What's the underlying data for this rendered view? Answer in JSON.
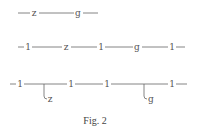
{
  "figure": {
    "caption": "Fig. 2",
    "rows": [
      {
        "id": "row1",
        "line": {
          "x1": 18,
          "x2": 98,
          "y": 13
        },
        "nodes": [
          {
            "label": "z",
            "x": 34
          },
          {
            "label": "g",
            "x": 78
          }
        ]
      },
      {
        "id": "row2",
        "line": {
          "x1": 18,
          "x2": 185,
          "y": 47
        },
        "nodes": [
          {
            "label": "1",
            "x": 28
          },
          {
            "label": "z",
            "x": 66
          },
          {
            "label": "1",
            "x": 101
          },
          {
            "label": "g",
            "x": 137
          },
          {
            "label": "1",
            "x": 172
          }
        ]
      },
      {
        "id": "row3",
        "line": {
          "x1": 10,
          "x2": 187,
          "y": 84
        },
        "nodes": [
          {
            "label": "1",
            "x": 20
          },
          {
            "label": "1",
            "x": 71
          },
          {
            "label": "1",
            "x": 107
          },
          {
            "label": "1",
            "x": 172
          }
        ],
        "branches": [
          {
            "label": "z",
            "x": 44
          },
          {
            "label": "g",
            "x": 144
          }
        ]
      }
    ]
  }
}
